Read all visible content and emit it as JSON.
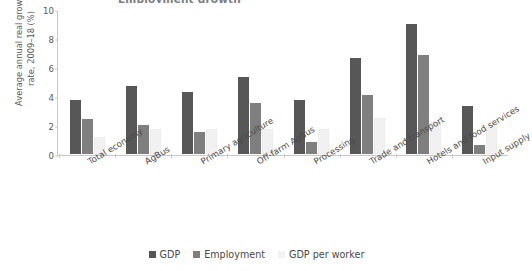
{
  "title_clipped": "Employment growth",
  "axis": {
    "y_title_line1": "Average annual real growth",
    "y_title_line2": "rate, 2009–18 (%)",
    "y_ticks": [
      "0",
      "2",
      "4",
      "6",
      "8",
      "10"
    ]
  },
  "legend": {
    "items": [
      {
        "label": "GDP",
        "color": "#575757",
        "swatch": "square-swatch-dark"
      },
      {
        "label": "Employment",
        "color": "#7f7f7f",
        "swatch": "square-swatch-medium"
      },
      {
        "label": "GDP per worker",
        "color": "#f3f3f3",
        "swatch": "square-swatch-light"
      }
    ]
  },
  "chart_data": {
    "type": "bar",
    "title": "Employment growth",
    "xlabel": "",
    "ylabel": "Average annual real growth rate, 2009–18 (%)",
    "ylim": [
      0,
      10
    ],
    "yticks": [
      0,
      2,
      4,
      6,
      8,
      10
    ],
    "grid": false,
    "legend_position": "bottom",
    "categories": [
      "Total economy",
      "AgBus",
      "Primary agriculture",
      "Off-farm AgBus",
      "Processing",
      "Trade and transport",
      "Hotels and food services",
      "Input supply"
    ],
    "series": [
      {
        "name": "GDP",
        "color": "#575757",
        "values": [
          3.7,
          4.7,
          4.3,
          5.3,
          3.7,
          6.6,
          9.0,
          3.3
        ]
      },
      {
        "name": "Employment",
        "color": "#7f7f7f",
        "values": [
          2.4,
          2.0,
          1.5,
          3.5,
          0.8,
          4.1,
          6.8,
          0.6
        ]
      },
      {
        "name": "GDP per worker",
        "color": "#f3f3f3",
        "values": [
          1.2,
          1.7,
          1.7,
          1.7,
          1.7,
          2.5,
          2.2,
          1.9
        ]
      }
    ]
  }
}
